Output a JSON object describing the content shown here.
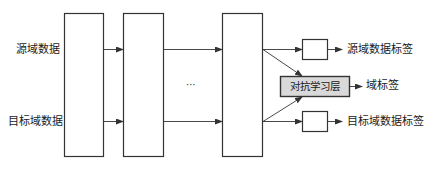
{
  "diagram": {
    "inputs": {
      "source": "源域数据",
      "target": "目标域数据"
    },
    "ellipsis": "···",
    "adversarial_layer": "对抗学习层",
    "outputs": {
      "source_label": "源域数据标签",
      "domain_label": "域标签",
      "target_label": "目标域数据标签"
    },
    "colors": {
      "stroke": "#333333",
      "adversarial_fill": "#d9d9d9"
    }
  }
}
